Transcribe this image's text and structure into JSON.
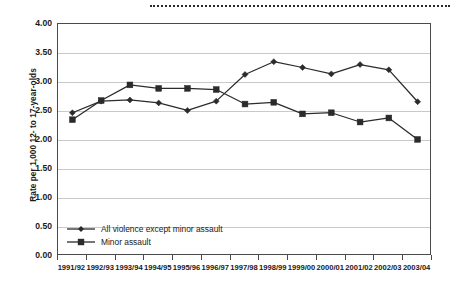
{
  "chart_data": {
    "type": "line",
    "title": "",
    "xlabel": "",
    "ylabel": "Rate per 1,000 12- to 17-year-olds",
    "ylim": [
      0.0,
      4.0
    ],
    "ytick_labels": [
      "4.00",
      "3.50",
      "3.00",
      "2.50",
      "2.00",
      "1.50",
      "1.00",
      "0.50",
      "0.00"
    ],
    "ytick_values": [
      4.0,
      3.5,
      3.0,
      2.5,
      2.0,
      1.5,
      1.0,
      0.5,
      0.0
    ],
    "grid": true,
    "legend_position": "inside-bottom-left",
    "categories": [
      "1991/92",
      "1992/93",
      "1993/94",
      "1994/95",
      "1995/96",
      "1996/97",
      "1997/98",
      "1998/99",
      "1999/00",
      "2000/01",
      "2001/02",
      "2002/03",
      "2003/04"
    ],
    "series": [
      {
        "name": "All violence except minor assault",
        "marker": "diamond",
        "values": [
          2.47,
          2.67,
          2.69,
          2.64,
          2.51,
          2.67,
          3.13,
          3.35,
          3.25,
          3.14,
          3.3,
          3.21,
          2.66
        ]
      },
      {
        "name": "Minor assault",
        "marker": "square",
        "values": [
          2.35,
          2.68,
          2.95,
          2.89,
          2.89,
          2.87,
          2.62,
          2.65,
          2.45,
          2.47,
          2.31,
          2.38,
          2.01
        ]
      }
    ]
  },
  "colors": {
    "series_line": "#2b2b2b",
    "gridline": "#c9c9c9",
    "axis": "#4a4a4a",
    "text": "#1a1a1a",
    "background": "#ffffff"
  },
  "legend": {
    "items": [
      {
        "label": "All violence except minor assault",
        "marker": "diamond"
      },
      {
        "label": "Minor assault",
        "marker": "square"
      }
    ]
  }
}
